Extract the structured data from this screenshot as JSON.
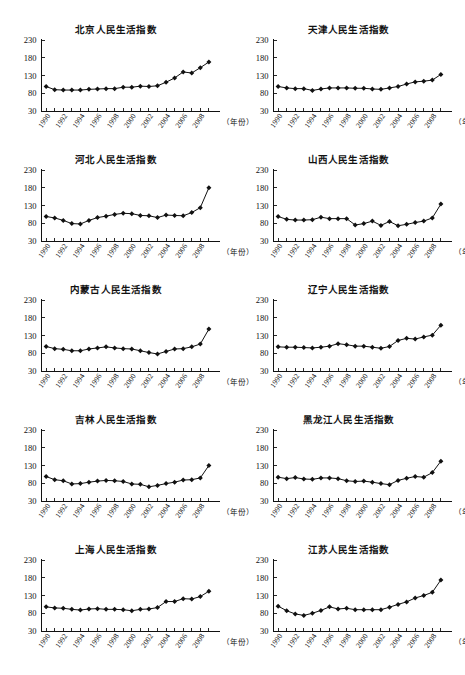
{
  "page": {
    "caption_axis_x": "（年份）",
    "background": "#ffffff",
    "ink": "#111111"
  },
  "chart_data": [
    {
      "type": "line",
      "title": "北京人民生活指数",
      "xlabel": "（年份）",
      "ylabel": "",
      "ylim": [
        30,
        230
      ],
      "yticks": [
        30,
        80,
        130,
        180,
        230
      ],
      "grid": false,
      "legend": "none",
      "x": [
        1990,
        1991,
        1992,
        1993,
        1994,
        1995,
        1996,
        1997,
        1998,
        1999,
        2000,
        2001,
        2002,
        2003,
        2004,
        2005,
        2006,
        2007,
        2008,
        2009
      ],
      "xticks": [
        1990,
        1992,
        1994,
        1996,
        1998,
        2000,
        2002,
        2004,
        2006,
        2008
      ],
      "values": [
        99,
        90,
        89,
        89,
        89,
        91,
        92,
        93,
        93,
        97,
        97,
        100,
        99,
        101,
        111,
        123,
        140,
        137,
        152,
        168
      ]
    },
    {
      "type": "line",
      "title": "天津人民生活指数",
      "xlabel": "（年份）",
      "ylabel": "",
      "ylim": [
        30,
        230
      ],
      "yticks": [
        30,
        80,
        130,
        180,
        230
      ],
      "grid": false,
      "legend": "none",
      "x": [
        1990,
        1991,
        1992,
        1993,
        1994,
        1995,
        1996,
        1997,
        1998,
        1999,
        2000,
        2001,
        2002,
        2003,
        2004,
        2005,
        2006,
        2007,
        2008,
        2009
      ],
      "xticks": [
        1990,
        1992,
        1994,
        1996,
        1998,
        2000,
        2002,
        2004,
        2006,
        2008
      ],
      "values": [
        99,
        95,
        93,
        93,
        88,
        92,
        95,
        95,
        95,
        94,
        94,
        92,
        91,
        95,
        99,
        106,
        112,
        114,
        117,
        133
      ]
    },
    {
      "type": "line",
      "title": "河北人民生活指数",
      "xlabel": "（年份）",
      "ylabel": "",
      "ylim": [
        30,
        230
      ],
      "yticks": [
        30,
        80,
        130,
        180,
        230
      ],
      "grid": false,
      "legend": "none",
      "x": [
        1990,
        1991,
        1992,
        1993,
        1994,
        1995,
        1996,
        1997,
        1998,
        1999,
        2000,
        2001,
        2002,
        2003,
        2004,
        2005,
        2006,
        2007,
        2008,
        2009
      ],
      "xticks": [
        1990,
        1992,
        1994,
        1996,
        1998,
        2000,
        2002,
        2004,
        2006,
        2008
      ],
      "values": [
        99,
        95,
        88,
        79,
        78,
        88,
        96,
        100,
        105,
        108,
        107,
        102,
        101,
        96,
        103,
        102,
        101,
        110,
        124,
        180
      ]
    },
    {
      "type": "line",
      "title": "山西人民生活指数",
      "xlabel": "（年份）",
      "ylabel": "",
      "ylim": [
        30,
        230
      ],
      "yticks": [
        30,
        80,
        130,
        180,
        230
      ],
      "grid": false,
      "legend": "none",
      "x": [
        1990,
        1991,
        1992,
        1993,
        1994,
        1995,
        1996,
        1997,
        1998,
        1999,
        2000,
        2001,
        2002,
        2003,
        2004,
        2005,
        2006,
        2007,
        2008,
        2009
      ],
      "xticks": [
        1990,
        1992,
        1994,
        1996,
        1998,
        2000,
        2002,
        2004,
        2006,
        2008
      ],
      "values": [
        99,
        91,
        89,
        89,
        90,
        97,
        93,
        93,
        93,
        75,
        79,
        86,
        74,
        85,
        73,
        77,
        82,
        86,
        95,
        134
      ]
    },
    {
      "type": "line",
      "title": "内蒙古人民生活指数",
      "xlabel": "（年份）",
      "ylabel": "",
      "ylim": [
        30,
        230
      ],
      "yticks": [
        30,
        80,
        130,
        180,
        230
      ],
      "grid": false,
      "legend": "none",
      "x": [
        1990,
        1991,
        1992,
        1993,
        1994,
        1995,
        1996,
        1997,
        1998,
        1999,
        2000,
        2001,
        2002,
        2003,
        2004,
        2005,
        2006,
        2007,
        2008,
        2009
      ],
      "xticks": [
        1990,
        1992,
        1994,
        1996,
        1998,
        2000,
        2002,
        2004,
        2006,
        2008
      ],
      "values": [
        99,
        93,
        91,
        87,
        87,
        92,
        95,
        98,
        95,
        93,
        92,
        87,
        82,
        78,
        85,
        92,
        93,
        98,
        106,
        148
      ]
    },
    {
      "type": "line",
      "title": "辽宁人民生活指数",
      "xlabel": "（年份）",
      "ylabel": "",
      "ylim": [
        30,
        230
      ],
      "yticks": [
        30,
        80,
        130,
        180,
        230
      ],
      "grid": false,
      "legend": "none",
      "x": [
        1990,
        1991,
        1992,
        1993,
        1994,
        1995,
        1996,
        1997,
        1998,
        1999,
        2000,
        2001,
        2002,
        2003,
        2004,
        2005,
        2006,
        2007,
        2008,
        2009
      ],
      "xticks": [
        1990,
        1992,
        1994,
        1996,
        1998,
        2000,
        2002,
        2004,
        2006,
        2008
      ],
      "values": [
        98,
        97,
        97,
        96,
        95,
        97,
        100,
        107,
        104,
        100,
        100,
        97,
        94,
        99,
        116,
        122,
        120,
        126,
        131,
        159
      ]
    },
    {
      "type": "line",
      "title": "吉林人民生活指数",
      "xlabel": "（年份）",
      "ylabel": "",
      "ylim": [
        30,
        230
      ],
      "yticks": [
        30,
        80,
        130,
        180,
        230
      ],
      "grid": false,
      "legend": "none",
      "x": [
        1990,
        1991,
        1992,
        1993,
        1994,
        1995,
        1996,
        1997,
        1998,
        1999,
        2000,
        2001,
        2002,
        2003,
        2004,
        2005,
        2006,
        2007,
        2008,
        2009
      ],
      "xticks": [
        1990,
        1992,
        1994,
        1996,
        1998,
        2000,
        2002,
        2004,
        2006,
        2008
      ],
      "values": [
        99,
        90,
        87,
        78,
        79,
        83,
        86,
        88,
        87,
        85,
        78,
        77,
        70,
        74,
        79,
        83,
        89,
        90,
        95,
        130
      ]
    },
    {
      "type": "line",
      "title": "黑龙江人民生活指数",
      "xlabel": "（年份）",
      "ylabel": "",
      "ylim": [
        30,
        230
      ],
      "yticks": [
        30,
        80,
        130,
        180,
        230
      ],
      "grid": false,
      "legend": "none",
      "x": [
        1990,
        1991,
        1992,
        1993,
        1994,
        1995,
        1996,
        1997,
        1998,
        1999,
        2000,
        2001,
        2002,
        2003,
        2004,
        2005,
        2006,
        2007,
        2008,
        2009
      ],
      "xticks": [
        1990,
        1992,
        1994,
        1996,
        1998,
        2000,
        2002,
        2004,
        2006,
        2008
      ],
      "values": [
        97,
        93,
        96,
        92,
        91,
        95,
        95,
        93,
        87,
        85,
        86,
        83,
        79,
        76,
        88,
        94,
        99,
        97,
        110,
        142
      ]
    },
    {
      "type": "line",
      "title": "上海人民生活指数",
      "xlabel": "（年份）",
      "ylabel": "",
      "ylim": [
        30,
        230
      ],
      "yticks": [
        30,
        80,
        130,
        180,
        230
      ],
      "grid": false,
      "legend": "none",
      "x": [
        1990,
        1991,
        1992,
        1993,
        1994,
        1995,
        1996,
        1997,
        1998,
        1999,
        2000,
        2001,
        2002,
        2003,
        2004,
        2005,
        2006,
        2007,
        2008,
        2009
      ],
      "xticks": [
        1990,
        1992,
        1994,
        1996,
        1998,
        2000,
        2002,
        2004,
        2006,
        2008
      ],
      "values": [
        98,
        95,
        94,
        91,
        89,
        92,
        93,
        91,
        91,
        90,
        87,
        91,
        92,
        96,
        113,
        113,
        121,
        120,
        127,
        142
      ]
    },
    {
      "type": "line",
      "title": "江苏人民生活指数",
      "xlabel": "（年份）",
      "ylabel": "",
      "ylim": [
        30,
        230
      ],
      "yticks": [
        30,
        80,
        130,
        180,
        230
      ],
      "grid": false,
      "legend": "none",
      "x": [
        1990,
        1991,
        1992,
        1993,
        1994,
        1995,
        1996,
        1997,
        1998,
        1999,
        2000,
        2001,
        2002,
        2003,
        2004,
        2005,
        2006,
        2007,
        2008,
        2009
      ],
      "xticks": [
        1990,
        1992,
        1994,
        1996,
        1998,
        2000,
        2002,
        2004,
        2006,
        2008
      ],
      "values": [
        100,
        87,
        78,
        74,
        80,
        88,
        98,
        92,
        94,
        90,
        90,
        90,
        90,
        97,
        105,
        112,
        123,
        130,
        139,
        174
      ]
    }
  ]
}
